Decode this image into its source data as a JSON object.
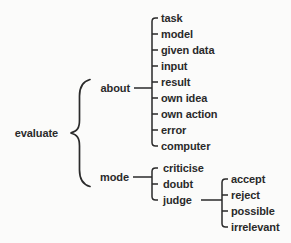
{
  "colors": {
    "ink": "#2a2a2a",
    "background": "#fbfbfa"
  },
  "tree": {
    "root": {
      "label": "evaluate"
    },
    "branches": [
      {
        "label": "about",
        "children": [
          {
            "label": "task"
          },
          {
            "label": "model"
          },
          {
            "label": "given data"
          },
          {
            "label": "input"
          },
          {
            "label": "result"
          },
          {
            "label": "own idea"
          },
          {
            "label": "own action"
          },
          {
            "label": "error"
          },
          {
            "label": "computer"
          }
        ]
      },
      {
        "label": "mode",
        "children": [
          {
            "label": "criticise"
          },
          {
            "label": "doubt"
          },
          {
            "label": "judge",
            "children": [
              {
                "label": "accept"
              },
              {
                "label": "reject"
              },
              {
                "label": "possible"
              },
              {
                "label": "irrelevant"
              }
            ]
          }
        ]
      }
    ]
  }
}
